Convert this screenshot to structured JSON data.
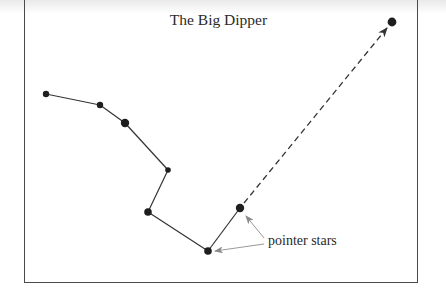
{
  "diagram": {
    "title": "The Big Dipper",
    "annotation_label": "pointer stars",
    "colors": {
      "star": "#1e1e1e",
      "line": "#333333",
      "pointer_arrow": "#9a9a9a",
      "frame": "#4a4a4a"
    },
    "stars": [
      {
        "id": "star-1",
        "x": 46,
        "y": 94,
        "r": 3.2
      },
      {
        "id": "star-2",
        "x": 100,
        "y": 105,
        "r": 3.2
      },
      {
        "id": "star-3",
        "x": 125,
        "y": 123,
        "r": 4.2
      },
      {
        "id": "star-4",
        "x": 168,
        "y": 170,
        "r": 2.8
      },
      {
        "id": "star-5",
        "x": 148,
        "y": 212,
        "r": 3.8
      },
      {
        "id": "star-6-pointer",
        "x": 208,
        "y": 251,
        "r": 3.8
      },
      {
        "id": "star-7-pointer",
        "x": 240,
        "y": 208,
        "r": 4.2
      },
      {
        "id": "polaris",
        "x": 392,
        "y": 22,
        "r": 4.4
      }
    ],
    "connections": [
      [
        "star-1",
        "star-2"
      ],
      [
        "star-2",
        "star-3"
      ],
      [
        "star-3",
        "star-4"
      ],
      [
        "star-4",
        "star-5"
      ],
      [
        "star-5",
        "star-6-pointer"
      ],
      [
        "star-6-pointer",
        "star-7-pointer"
      ]
    ],
    "dashed_arrow": {
      "from": "star-7-pointer",
      "to": "polaris"
    }
  }
}
